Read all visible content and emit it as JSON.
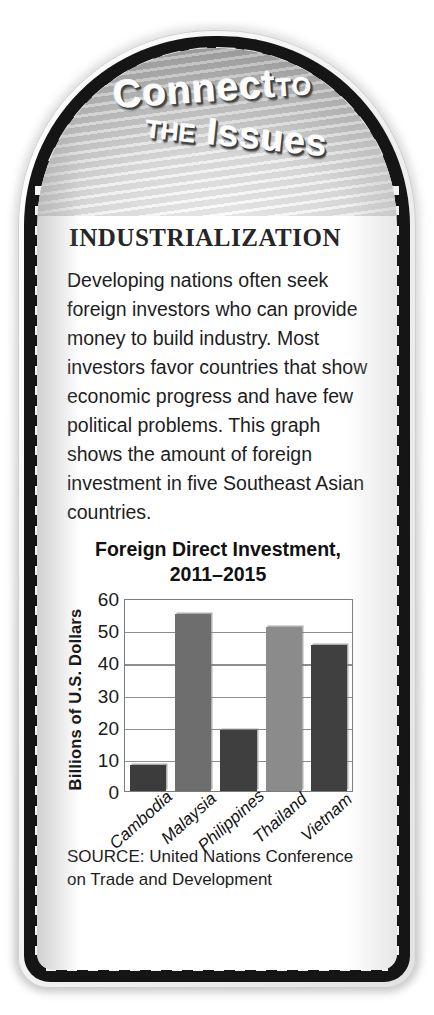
{
  "frame": {
    "style": "rounded-arched-dark-border",
    "accent_dark": "#151515",
    "banner_gradient_light": "#ffffff",
    "banner_gradient_dark": "#7d7d7d"
  },
  "banner": {
    "line1_main": "Connect",
    "line1_small": "TO",
    "line2_small": "THE",
    "line2_main": "Issues"
  },
  "feature": {
    "section_heading": "INDUSTRIALIZATION",
    "paragraph": "Developing nations often seek foreign investors who can provide money to build industry. Most investors favor countries that show economic progress and have few political problems. This graph shows the amount of foreign investment in five Southeast Asian countries."
  },
  "source": {
    "text": "SOURCE: United Nations Conference on Trade and Development"
  },
  "chart_data": {
    "type": "bar",
    "title": "Foreign Direct Investment, 2011–2015",
    "title_line1": "Foreign Direct Investment,",
    "title_line2": "2011–2015",
    "xlabel": "",
    "ylabel": "Billions of U.S. Dollars",
    "categories": [
      "Cambodia",
      "Malaysia",
      "Philippines",
      "Thailand",
      "Vietnam"
    ],
    "values": [
      8,
      55,
      19,
      51,
      45.5
    ],
    "bar_colors": [
      "#3c3c3c",
      "#6e6e6e",
      "#3f3f3f",
      "#8b8b8b",
      "#404040"
    ],
    "ylim": [
      0,
      60
    ],
    "yticks": [
      60,
      50,
      40,
      30,
      20,
      10,
      0
    ],
    "ytick_labels": [
      "60",
      "50",
      "40",
      "30",
      "20",
      "10",
      "0"
    ],
    "grid": true,
    "grid_axis": "y",
    "legend": false,
    "legend_position": "none",
    "unit": "Billions of U.S. Dollars"
  }
}
